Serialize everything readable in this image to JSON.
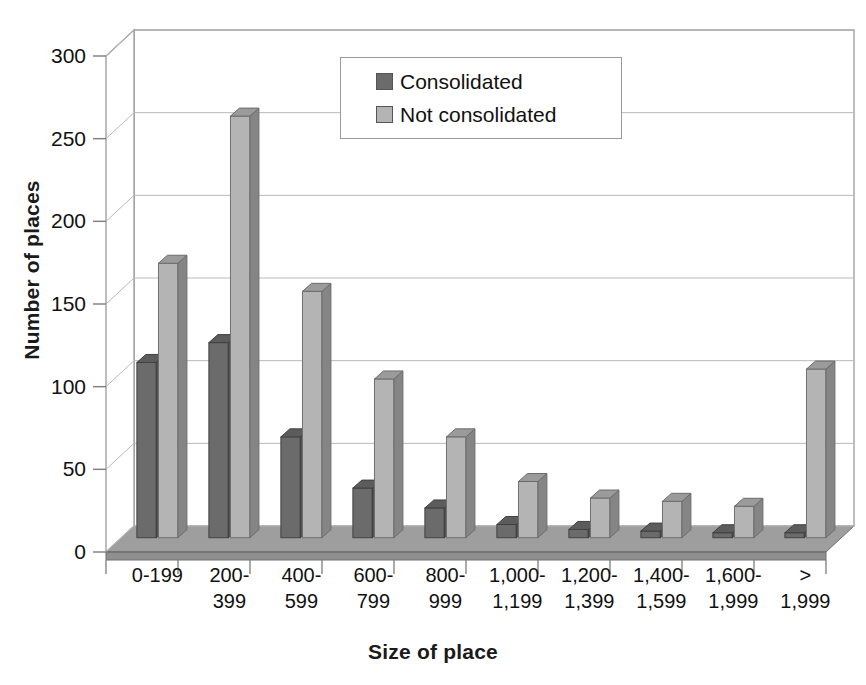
{
  "chart_data": {
    "type": "bar",
    "title": "",
    "subtitle": "",
    "xlabel": "Size of place",
    "ylabel": "Number of places",
    "ylim": [
      0,
      300
    ],
    "yticks": [
      0,
      50,
      100,
      150,
      200,
      250,
      300
    ],
    "ytick_labels": [
      "0",
      "50",
      "100",
      "150",
      "200",
      "250",
      "300"
    ],
    "grid": true,
    "style": "3d-clustered-column",
    "legend_position": "top-center",
    "categories": [
      "0-199",
      "200-399",
      "400-599",
      "600-799",
      "800-999",
      "1,000-1,199",
      "1,200-1,399",
      "1,400-1,599",
      "1,600-1,999",
      "> 1,999"
    ],
    "category_lines": [
      [
        "0-199"
      ],
      [
        "200-",
        "399"
      ],
      [
        "400-",
        "599"
      ],
      [
        "600-",
        "799"
      ],
      [
        "800-",
        "999"
      ],
      [
        "1,000-",
        "1,199"
      ],
      [
        "1,200-",
        "1,399"
      ],
      [
        "1,400-",
        "1,599"
      ],
      [
        "1,600-",
        "1,999"
      ],
      [
        ">",
        "1,999"
      ]
    ],
    "series": [
      {
        "name": "Consolidated",
        "color": "#6b6b6b",
        "values": [
          106,
          118,
          61,
          30,
          18,
          8,
          5,
          4,
          3,
          3
        ]
      },
      {
        "name": "Not consolidated",
        "color": "#b4b4b4",
        "values": [
          166,
          255,
          149,
          96,
          61,
          34,
          24,
          22,
          19,
          102
        ]
      }
    ]
  },
  "legend": {
    "items": [
      {
        "label": "Consolidated",
        "color": "#6b6b6b"
      },
      {
        "label": "Not consolidated",
        "color": "#b4b4b4"
      }
    ]
  },
  "axes": {
    "y_title": "Number of places",
    "x_title": "Size of place"
  }
}
